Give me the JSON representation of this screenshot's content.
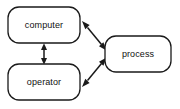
{
  "diagram": {
    "type": "block-diagram",
    "title": "",
    "background_color": "#ffffff",
    "stroke_color": "#1a1a1a",
    "fill_color": "#ffffff",
    "nodes": [
      {
        "id": "computer",
        "label": "computer",
        "shape": "rounded-rectangle",
        "x": 8,
        "y": 7,
        "width": 72,
        "height": 36,
        "radius": 11
      },
      {
        "id": "operator",
        "label": "operator",
        "shape": "rounded-rectangle",
        "x": 8,
        "y": 64,
        "width": 72,
        "height": 36,
        "radius": 11
      },
      {
        "id": "process",
        "label": "process",
        "shape": "rounded-rectangle",
        "x": 105,
        "y": 36,
        "width": 66,
        "height": 36,
        "radius": 11
      }
    ],
    "edges": [
      {
        "id": "computer-operator",
        "from": "computer",
        "to": "operator",
        "direction": "bidirectional",
        "style": "solid",
        "label": ""
      },
      {
        "id": "computer-process",
        "from": "computer",
        "to": "process",
        "direction": "bidirectional",
        "style": "solid",
        "label": ""
      },
      {
        "id": "operator-process",
        "from": "operator",
        "to": "process",
        "direction": "bidirectional",
        "style": "solid",
        "label": ""
      }
    ]
  }
}
